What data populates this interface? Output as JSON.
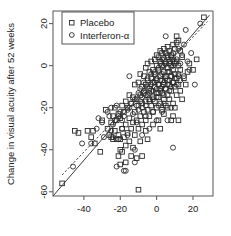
{
  "chart_data": {
    "type": "scatter",
    "title": "",
    "xlabel": "",
    "ylabel": "Change in visual acuity after 52 weeks",
    "xlim": [
      -57,
      31
    ],
    "ylim": [
      -62,
      26
    ],
    "xticks": [
      -40,
      -20,
      0,
      20
    ],
    "yticks": [
      20,
      0,
      -20,
      -40,
      -60
    ],
    "xtick_labels": [
      "-40",
      "-20",
      "0",
      "20"
    ],
    "ytick_labels": [
      "20",
      "0",
      "-20",
      "-40",
      "-60"
    ],
    "grid": false,
    "legend": {
      "position": "top-left",
      "entries": [
        {
          "label": "Placebo",
          "marker": "square"
        },
        {
          "label": "Interferon-α",
          "marker": "circle"
        }
      ]
    },
    "annotations": [
      {
        "type": "line",
        "name": "identity-line",
        "style": "solid",
        "x": [
          -57,
          29
        ],
        "y": [
          -62,
          24
        ]
      },
      {
        "type": "line",
        "name": "regression-line",
        "style": "dashed",
        "x": [
          -52,
          28
        ],
        "y": [
          -52,
          21
        ]
      }
    ],
    "series": [
      {
        "name": "Placebo",
        "marker": "square",
        "points": [
          [
            -52,
            -56
          ],
          [
            -45,
            -31
          ],
          [
            -43,
            -32
          ],
          [
            -38,
            -31
          ],
          [
            -36,
            -34
          ],
          [
            -34,
            -37
          ],
          [
            -31,
            -41
          ],
          [
            -30,
            -26
          ],
          [
            -28,
            -21
          ],
          [
            -27,
            -30
          ],
          [
            -26,
            -33
          ],
          [
            -25,
            -34
          ],
          [
            -25,
            -27
          ],
          [
            -24,
            -35
          ],
          [
            -24,
            -24
          ],
          [
            -23,
            -31
          ],
          [
            -23,
            -20
          ],
          [
            -22,
            -35
          ],
          [
            -22,
            -26
          ],
          [
            -21,
            -43
          ],
          [
            -21,
            -33
          ],
          [
            -21,
            -23
          ],
          [
            -20,
            -47
          ],
          [
            -20,
            -35
          ],
          [
            -20,
            -25
          ],
          [
            -19,
            -41
          ],
          [
            -19,
            -30
          ],
          [
            -19,
            -19
          ],
          [
            -18,
            -34
          ],
          [
            -18,
            -22
          ],
          [
            -17,
            -46
          ],
          [
            -17,
            -28
          ],
          [
            -17,
            -17
          ],
          [
            -16,
            -32
          ],
          [
            -16,
            -20
          ],
          [
            -15,
            -36
          ],
          [
            -15,
            -25
          ],
          [
            -15,
            -14
          ],
          [
            -14,
            -30
          ],
          [
            -14,
            -18
          ],
          [
            -13,
            -27
          ],
          [
            -13,
            -15
          ],
          [
            -12,
            -33
          ],
          [
            -12,
            -22
          ],
          [
            -12,
            -9
          ],
          [
            -11,
            -26
          ],
          [
            -11,
            -16
          ],
          [
            -10,
            -59
          ],
          [
            -10,
            -30
          ],
          [
            -10,
            -19
          ],
          [
            -10,
            -8
          ],
          [
            -9,
            -24
          ],
          [
            -9,
            -14
          ],
          [
            -9,
            -4
          ],
          [
            -8,
            -28
          ],
          [
            -8,
            -18
          ],
          [
            -8,
            -10
          ],
          [
            -7,
            -22
          ],
          [
            -7,
            -13
          ],
          [
            -7,
            -5
          ],
          [
            -6,
            -26
          ],
          [
            -6,
            -17
          ],
          [
            -6,
            -9
          ],
          [
            -6,
            -1
          ],
          [
            -5,
            -21
          ],
          [
            -5,
            -14
          ],
          [
            -5,
            -7
          ],
          [
            -5,
            1
          ],
          [
            -4,
            -24
          ],
          [
            -4,
            -16
          ],
          [
            -4,
            -11
          ],
          [
            -4,
            -3
          ],
          [
            -3,
            -19
          ],
          [
            -3,
            -12
          ],
          [
            -3,
            -6
          ],
          [
            -3,
            2
          ],
          [
            -2,
            -22
          ],
          [
            -2,
            -15
          ],
          [
            -2,
            -8
          ],
          [
            -2,
            -2
          ],
          [
            -1,
            -17
          ],
          [
            -1,
            -10
          ],
          [
            -1,
            -4
          ],
          [
            -1,
            3
          ],
          [
            0,
            -20
          ],
          [
            0,
            -13
          ],
          [
            0,
            -7
          ],
          [
            0,
            0
          ],
          [
            0,
            5
          ],
          [
            1,
            -26
          ],
          [
            1,
            -15
          ],
          [
            1,
            -9
          ],
          [
            1,
            -2
          ],
          [
            1,
            4
          ],
          [
            2,
            -18
          ],
          [
            2,
            -11
          ],
          [
            2,
            -5
          ],
          [
            2,
            2
          ],
          [
            2,
            7
          ],
          [
            3,
            -21
          ],
          [
            3,
            -13
          ],
          [
            3,
            -7
          ],
          [
            3,
            0
          ],
          [
            3,
            6
          ],
          [
            4,
            -16
          ],
          [
            4,
            -9
          ],
          [
            4,
            -3
          ],
          [
            4,
            3
          ],
          [
            4,
            8
          ],
          [
            5,
            -19
          ],
          [
            5,
            -11
          ],
          [
            5,
            -5
          ],
          [
            5,
            1
          ],
          [
            5,
            6
          ],
          [
            6,
            -14
          ],
          [
            6,
            -7
          ],
          [
            6,
            -1
          ],
          [
            6,
            4
          ],
          [
            6,
            9
          ],
          [
            7,
            -16
          ],
          [
            7,
            -9
          ],
          [
            7,
            -3
          ],
          [
            7,
            2
          ],
          [
            7,
            7
          ],
          [
            8,
            -26
          ],
          [
            8,
            -12
          ],
          [
            8,
            -5
          ],
          [
            8,
            0
          ],
          [
            8,
            5
          ],
          [
            9,
            -18
          ],
          [
            9,
            -8
          ],
          [
            9,
            -2
          ],
          [
            9,
            3
          ],
          [
            9,
            10
          ],
          [
            10,
            -20
          ],
          [
            10,
            -10
          ],
          [
            10,
            -4
          ],
          [
            10,
            1
          ],
          [
            10,
            8
          ],
          [
            11,
            -14
          ],
          [
            11,
            -6
          ],
          [
            11,
            2
          ],
          [
            11,
            11
          ],
          [
            12,
            -26
          ],
          [
            12,
            -9
          ],
          [
            12,
            0
          ],
          [
            12,
            12
          ],
          [
            13,
            -12
          ],
          [
            13,
            -2
          ],
          [
            13,
            7
          ],
          [
            14,
            -16
          ],
          [
            14,
            4
          ],
          [
            15,
            -6
          ],
          [
            16,
            -9
          ],
          [
            17,
            -3
          ],
          [
            18,
            1
          ],
          [
            20,
            -2
          ],
          [
            22,
            3
          ],
          [
            26,
            23
          ],
          [
            -35,
            -31
          ],
          [
            -13,
            -39
          ],
          [
            -11,
            -44
          ],
          [
            -9,
            -36
          ],
          [
            -6,
            -31
          ],
          [
            -2,
            -28
          ],
          [
            4,
            -23
          ],
          [
            6,
            -20
          ],
          [
            9,
            -24
          ],
          [
            -8,
            -43
          ],
          [
            -17,
            -38
          ],
          [
            -20,
            -40
          ],
          [
            2,
            -30
          ],
          [
            -5,
            -35
          ],
          [
            -14,
            -43
          ],
          [
            11,
            14
          ]
        ]
      },
      {
        "name": "Interferon-α",
        "marker": "circle",
        "points": [
          [
            -46,
            -48
          ],
          [
            -41,
            -37
          ],
          [
            -36,
            -37
          ],
          [
            -33,
            -30
          ],
          [
            -32,
            -25
          ],
          [
            -30,
            -27
          ],
          [
            -29,
            -34
          ],
          [
            -27,
            -22
          ],
          [
            -26,
            -24
          ],
          [
            -25,
            -20
          ],
          [
            -24,
            -28
          ],
          [
            -23,
            -26
          ],
          [
            -22,
            -19
          ],
          [
            -22,
            -48
          ],
          [
            -21,
            -24
          ],
          [
            -20,
            -22
          ],
          [
            -19,
            -26
          ],
          [
            -18,
            -50
          ],
          [
            -18,
            -24
          ],
          [
            -17,
            -50
          ],
          [
            -16,
            -21
          ],
          [
            -15,
            -20
          ],
          [
            -15,
            -5
          ],
          [
            -14,
            -18
          ],
          [
            -13,
            -23
          ],
          [
            -12,
            -16
          ],
          [
            -12,
            -46
          ],
          [
            -11,
            -19
          ],
          [
            -10,
            -13
          ],
          [
            -10,
            -21
          ],
          [
            -9,
            -17
          ],
          [
            -9,
            -11
          ],
          [
            -8,
            -15
          ],
          [
            -8,
            -20
          ],
          [
            -7,
            -12
          ],
          [
            -7,
            -8
          ],
          [
            -6,
            -14
          ],
          [
            -6,
            -19
          ],
          [
            -5,
            -10
          ],
          [
            -5,
            -6
          ],
          [
            -4,
            -13
          ],
          [
            -4,
            -17
          ],
          [
            -3,
            -9
          ],
          [
            -3,
            -4
          ],
          [
            -2,
            -12
          ],
          [
            -2,
            -16
          ],
          [
            -1,
            -8
          ],
          [
            -1,
            -3
          ],
          [
            0,
            -11
          ],
          [
            0,
            -15
          ],
          [
            0,
            -6
          ],
          [
            1,
            -9
          ],
          [
            1,
            -1
          ],
          [
            1,
            -13
          ],
          [
            2,
            -7
          ],
          [
            2,
            -12
          ],
          [
            2,
            1
          ],
          [
            3,
            -10
          ],
          [
            3,
            -4
          ],
          [
            3,
            3
          ],
          [
            4,
            -8
          ],
          [
            4,
            -14
          ],
          [
            4,
            0
          ],
          [
            5,
            -6
          ],
          [
            5,
            -11
          ],
          [
            5,
            2
          ],
          [
            6,
            -9
          ],
          [
            6,
            -3
          ],
          [
            6,
            5
          ],
          [
            7,
            -7
          ],
          [
            7,
            -12
          ],
          [
            7,
            1
          ],
          [
            8,
            -5
          ],
          [
            8,
            -10
          ],
          [
            8,
            4
          ],
          [
            9,
            -8
          ],
          [
            9,
            0
          ],
          [
            9,
            6
          ],
          [
            10,
            -6
          ],
          [
            10,
            2
          ],
          [
            11,
            -9
          ],
          [
            11,
            3
          ],
          [
            12,
            -4
          ],
          [
            12,
            8
          ],
          [
            13,
            1
          ],
          [
            13,
            -7
          ],
          [
            14,
            5
          ],
          [
            15,
            -5
          ],
          [
            15,
            10
          ],
          [
            16,
            17
          ],
          [
            17,
            2
          ],
          [
            18,
            -2
          ],
          [
            19,
            6
          ],
          [
            21,
            -9
          ],
          [
            24,
            20
          ],
          [
            -12,
            -40
          ],
          [
            -8,
            -33
          ],
          [
            -4,
            -30
          ],
          [
            0,
            -26
          ],
          [
            3,
            -22
          ],
          [
            6,
            -26
          ],
          [
            9,
            -39
          ],
          [
            -16,
            -33
          ],
          [
            -19,
            -30
          ],
          [
            -24,
            -34
          ],
          [
            -2,
            -22
          ],
          [
            4,
            -18
          ],
          [
            -11,
            -27
          ],
          [
            -6,
            -24
          ],
          [
            12,
            -5
          ],
          [
            5,
            14
          ],
          [
            -21,
            -35
          ],
          [
            -25,
            -31
          ],
          [
            8,
            -20
          ],
          [
            1,
            -19
          ]
        ]
      }
    ]
  }
}
